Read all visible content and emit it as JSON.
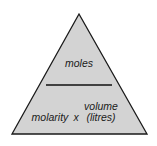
{
  "diagram": {
    "type": "formula-triangle",
    "top": {
      "label": "moles"
    },
    "bottom": {
      "left": {
        "label": "molarity"
      },
      "operator": {
        "label": "x"
      },
      "right": {
        "line1": "volume",
        "line2": "(litres)"
      }
    },
    "colors": {
      "fill": "#d3d3d3",
      "stroke": "#1a1a1a",
      "divider": "#111111",
      "background": "#ffffff"
    }
  }
}
